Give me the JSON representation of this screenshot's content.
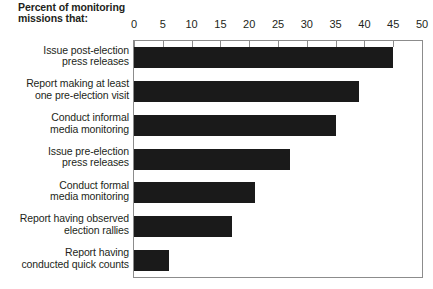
{
  "chart": {
    "title_lines": [
      "Percent of",
      "monitoring",
      "missions that:"
    ],
    "bar_color": "#1a1a1a",
    "frame_color": "#8c8c8c",
    "text_color": "#231f20"
  },
  "chart_data": {
    "type": "bar",
    "orientation": "horizontal",
    "title": "Percent of monitoring missions that:",
    "xlabel": "",
    "ylabel": "",
    "xlim": [
      0,
      50
    ],
    "xticks": [
      0,
      5,
      10,
      15,
      20,
      25,
      30,
      35,
      40,
      45,
      50
    ],
    "grid": false,
    "legend": false,
    "categories": [
      "Issue post-election press releases",
      "Report making at least one pre-election visit",
      "Conduct informal media monitoring",
      "Issue pre-election press releases",
      "Conduct formal media monitoring",
      "Report having observed election rallies",
      "Report having conducted quick counts"
    ],
    "category_lines": [
      [
        "Issue post-election",
        "press releases"
      ],
      [
        "Report making at least",
        "one pre-election visit"
      ],
      [
        "Conduct informal",
        "media monitoring"
      ],
      [
        "Issue pre-election",
        "press releases"
      ],
      [
        "Conduct formal",
        "media monitoring"
      ],
      [
        "Report having observed",
        "election rallies"
      ],
      [
        "Report having",
        "conducted quick counts"
      ]
    ],
    "values": [
      45,
      39,
      35,
      27,
      21,
      17,
      6
    ]
  }
}
